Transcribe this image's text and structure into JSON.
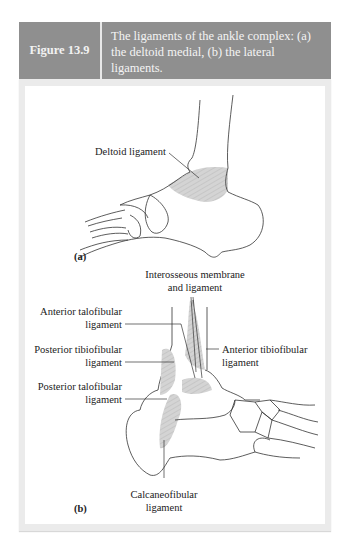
{
  "figure": {
    "number": "Figure 13.9",
    "caption": "The ligaments of the ankle complex: (a) the deltoid medial, (b) the lateral ligaments."
  },
  "panel_a": {
    "tag": "(a)",
    "labels": {
      "deltoid": "Deltoid ligament"
    }
  },
  "panel_b": {
    "tag": "(b)",
    "labels": {
      "interosseous_1": "Interosseous membrane",
      "interosseous_2": "and ligament",
      "ant_talofib_1": "Anterior talofibular",
      "ant_talofib_2": "ligament",
      "post_tibiofib_1": "Posterior tibiofibular",
      "post_tibiofib_2": "ligament",
      "post_talofib_1": "Posterior talofibular",
      "post_talofib_2": "ligament",
      "ant_tibiofib_1": "Anterior tibiofibular",
      "ant_tibiofib_2": "ligament",
      "calcaneofib_1": "Calcaneofibular",
      "calcaneofib_2": "ligament"
    }
  },
  "colors": {
    "header_bg": "#8f8f8f",
    "panel_border": "#ebebeb",
    "ligament_fill": "#c8c8c8",
    "line": "#222222"
  }
}
